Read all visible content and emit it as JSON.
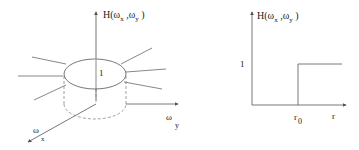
{
  "left_diagram": {
    "axis_label_h": "H(",
    "axis_label_wx_inner": "ω",
    "axis_label_wx_sub": "x",
    "axis_label_sep": " ,ω",
    "axis_label_wy_sub": "y",
    "axis_label_close": " )",
    "value_label": "1",
    "wy_label": "ω",
    "wy_sub": "y",
    "wx_label": "ω",
    "wx_sub": "x"
  },
  "right_diagram": {
    "axis_label_h": "H(",
    "axis_label_wx_inner": "ω",
    "axis_label_wx_sub": "x",
    "axis_label_sep": " ,ω",
    "axis_label_wy_sub": "y",
    "axis_label_close": " )",
    "y_tick_label": "1",
    "x_tick_label": "r",
    "x_tick_sub": "0",
    "x_axis_label": "r"
  },
  "colors": {
    "line": "#555555",
    "dashed": "#777777",
    "text": "#222222"
  }
}
